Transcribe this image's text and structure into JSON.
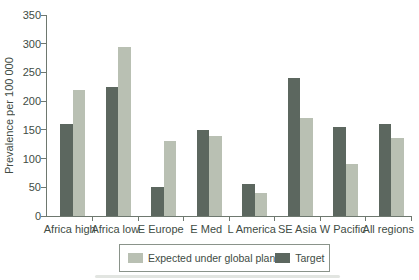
{
  "figure": {
    "background": "#ffffff"
  },
  "chart_data": {
    "type": "bar",
    "title": "",
    "xlabel": "",
    "ylabel": "Prevalence per 100 000",
    "ylim": [
      0,
      350
    ],
    "ytick_step": 50,
    "yticks": [
      0,
      50,
      100,
      150,
      200,
      250,
      300,
      350
    ],
    "categories": [
      "Africa high",
      "Africa low",
      "E Europe",
      "E Med",
      "L America",
      "SE Asia",
      "W Pacific",
      "All regions"
    ],
    "series": [
      {
        "name": "Expected under global plan",
        "color": "#b9c0b3",
        "values": [
          220,
          295,
          130,
          140,
          40,
          170,
          90,
          135
        ]
      },
      {
        "name": "Target",
        "color": "#5c675f",
        "values": [
          160,
          225,
          50,
          150,
          55,
          240,
          155,
          160
        ]
      }
    ],
    "bar_order_left_to_right": [
      "Target",
      "Expected under global plan"
    ],
    "legend_position": "bottom",
    "grid": false
  },
  "colors": {
    "axis": "#6e786f",
    "text": "#414c44",
    "legend_border": "#8a938a"
  }
}
